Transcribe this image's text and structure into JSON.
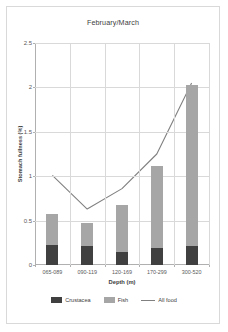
{
  "chart_data": {
    "type": "bar",
    "title": "February/March",
    "xlabel": "Depth (m)",
    "ylabel": "Stomach fullness (%)",
    "categories": [
      "065-089",
      "090-119",
      "120-169",
      "170-299",
      "300-520"
    ],
    "ylim": [
      0,
      2.5
    ],
    "ytick_labels": [
      "0",
      "0.5",
      "1",
      "1.5",
      "2",
      "2.5"
    ],
    "ytick_values": [
      0,
      0.5,
      1,
      1.5,
      2,
      2.5
    ],
    "grid": true,
    "legend_position": "bottom",
    "stacked": true,
    "series": [
      {
        "name": "Crustacea",
        "type": "bar",
        "color": "#404040",
        "values": [
          0.23,
          0.21,
          0.15,
          0.19,
          0.21
        ]
      },
      {
        "name": "Fish",
        "type": "bar",
        "color": "#a6a6a6",
        "values": [
          0.34,
          0.26,
          0.53,
          0.93,
          1.82
        ]
      },
      {
        "name": "All food",
        "type": "line",
        "color": "#808080",
        "values": [
          1.01,
          0.63,
          0.86,
          1.25,
          2.05
        ]
      }
    ]
  },
  "legend": {
    "items": [
      {
        "label": "Crustacea",
        "marker": "box-dark",
        "color": "#404040"
      },
      {
        "label": "Fish",
        "marker": "box-light",
        "color": "#a6a6a6"
      },
      {
        "label": "All food",
        "marker": "line",
        "color": "#808080"
      }
    ]
  }
}
